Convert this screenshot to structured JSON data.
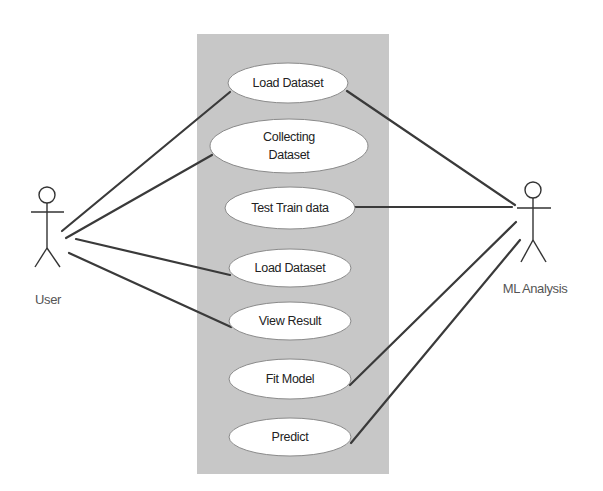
{
  "diagram": {
    "type": "UML use case diagram",
    "colors": {
      "background": "#ffffff",
      "system_boundary_fill": "#c7c7c7",
      "use_case_fill": "#ffffff",
      "line": "#3a3a3a"
    },
    "system_boundary": {
      "x": 197,
      "y": 34,
      "width": 192,
      "height": 440
    },
    "actors": [
      {
        "id": "user",
        "label": "User",
        "head": {
          "cx": 47,
          "cy": 195,
          "r": 8
        }
      },
      {
        "id": "ml",
        "label": "ML Analysis",
        "head": {
          "cx": 533,
          "cy": 190,
          "r": 8
        }
      }
    ],
    "use_cases": [
      {
        "id": "uc1",
        "label": "Load Dataset",
        "lines": [
          "Load Dataset"
        ],
        "cx": 288,
        "cy": 83,
        "rx": 60,
        "ry": 20
      },
      {
        "id": "uc2",
        "label": "Collecting Dataset",
        "lines": [
          "Collecting",
          "Dataset"
        ],
        "cx": 289,
        "cy": 146,
        "rx": 79,
        "ry": 27
      },
      {
        "id": "uc3",
        "label": "Test Train data",
        "lines": [
          "Test Train data"
        ],
        "cx": 290,
        "cy": 208,
        "rx": 65,
        "ry": 21
      },
      {
        "id": "uc4",
        "label": "Load Dataset",
        "lines": [
          "Load Dataset"
        ],
        "cx": 290,
        "cy": 268,
        "rx": 61,
        "ry": 19
      },
      {
        "id": "uc5",
        "label": "View Result",
        "lines": [
          "View Result"
        ],
        "cx": 290,
        "cy": 321,
        "rx": 61,
        "ry": 19
      },
      {
        "id": "uc6",
        "label": "Fit Model",
        "lines": [
          "Fit Model"
        ],
        "cx": 290,
        "cy": 379,
        "rx": 61,
        "ry": 20
      },
      {
        "id": "uc7",
        "label": "Predict",
        "lines": [
          "Predict"
        ],
        "cx": 290,
        "cy": 437,
        "rx": 61,
        "ry": 19
      }
    ],
    "associations": [
      {
        "from": "User",
        "to": "Load Dataset (1)"
      },
      {
        "from": "User",
        "to": "Collecting Dataset"
      },
      {
        "from": "User",
        "to": "Load Dataset (2)"
      },
      {
        "from": "User",
        "to": "View Result"
      },
      {
        "from": "ML Analysis",
        "to": "Load Dataset (1)"
      },
      {
        "from": "ML Analysis",
        "to": "Test Train data"
      },
      {
        "from": "ML Analysis",
        "to": "Fit Model"
      },
      {
        "from": "ML Analysis",
        "to": "Predict"
      }
    ]
  }
}
